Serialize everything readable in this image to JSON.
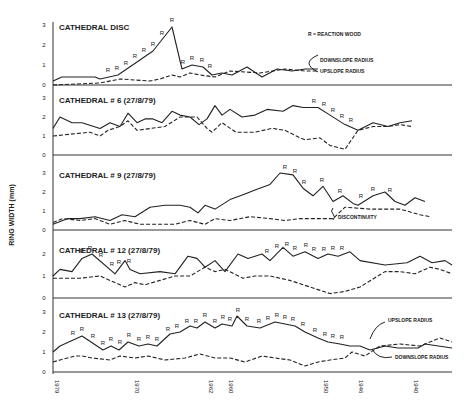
{
  "chart_data": {
    "type": "line",
    "title": "",
    "ylabel": "RING WIDTH (mm)",
    "xlabel": "",
    "x_ticks": [
      "1979",
      "1970",
      "1962",
      "1960",
      "1950",
      "1946",
      "1940"
    ],
    "x_tick_pos": [
      53,
      133,
      207,
      227,
      322,
      357,
      412
    ],
    "legend_note": "R = REACTION WOOD",
    "panels": [
      {
        "title": "CATHEDRAL DISC",
        "yticks": [
          "0",
          "1",
          "2",
          "3"
        ],
        "ylim": [
          0,
          3
        ],
        "annotations": [
          "DOWNSLOPE RADIUS",
          "UPSLOPE RADIUS"
        ],
        "series": [
          {
            "name": "Downslope radius",
            "style": "solid",
            "x": [
              53,
              62,
              95,
              100,
              118,
              153,
              172,
              182,
              192,
              203,
              212,
              222,
              232,
              247,
              262,
              277,
              292,
              305,
              318
            ],
            "values": [
              0.2,
              0.4,
              0.4,
              0.3,
              0.5,
              1.7,
              2.9,
              0.8,
              1.0,
              0.9,
              0.5,
              0.6,
              0.5,
              0.9,
              0.4,
              0.8,
              0.7,
              0.8,
              0.8
            ]
          },
          {
            "name": "Upslope radius",
            "style": "dashed",
            "x": [
              53,
              100,
              120,
              150,
              160,
              172,
              180,
              190,
              200,
              215,
              230,
              260,
              285,
              305,
              318
            ],
            "values": [
              0.0,
              0.1,
              0.3,
              0.2,
              0.3,
              0.5,
              0.4,
              0.6,
              0.5,
              0.4,
              0.7,
              0.6,
              0.8,
              0.7,
              0.7
            ]
          }
        ],
        "r_marks_x": [
          108,
          117,
          126,
          135,
          144,
          153,
          162,
          172,
          183,
          192,
          202,
          210
        ]
      },
      {
        "title": "CATHEDRAL # 6 (27/8/79)",
        "yticks": [
          "0",
          "1",
          "2",
          "3"
        ],
        "ylim": [
          0,
          3
        ],
        "series": [
          {
            "name": "Downslope radius",
            "style": "solid",
            "x": [
              53,
              60,
              72,
              82,
              100,
              110,
              120,
              128,
              137,
              145,
              153,
              162,
              172,
              180,
              190,
              199,
              207,
              215,
              222,
              230,
              242,
              255,
              267,
              283,
              293,
              303,
              318,
              330,
              345,
              358,
              373,
              388,
              400,
              412
            ],
            "values": [
              1.4,
              2.0,
              1.7,
              1.7,
              1.4,
              1.7,
              1.5,
              2.2,
              1.7,
              1.9,
              1.9,
              1.7,
              2.3,
              2.1,
              2.0,
              1.6,
              1.9,
              2.6,
              2.1,
              2.4,
              2.0,
              2.1,
              2.4,
              2.3,
              2.6,
              2.5,
              2.5,
              2.1,
              1.6,
              1.3,
              1.7,
              1.5,
              1.7,
              1.8
            ]
          },
          {
            "name": "Upslope radius",
            "style": "dashed",
            "x": [
              53,
              90,
              100,
              108,
              120,
              128,
              137,
              165,
              180,
              197,
              207,
              212,
              222,
              236,
              255,
              272,
              285,
              300,
              305,
              320,
              330,
              345,
              358,
              373,
              388,
              400,
              412
            ],
            "values": [
              1.0,
              1.2,
              1.0,
              1.3,
              1.5,
              1.8,
              1.3,
              1.5,
              2.0,
              2.0,
              1.4,
              1.2,
              1.7,
              1.2,
              1.2,
              1.4,
              1.3,
              0.9,
              0.8,
              0.9,
              0.5,
              0.3,
              1.3,
              1.5,
              1.5,
              1.6,
              1.5
            ]
          }
        ],
        "r_marks_x": [
          314,
          324,
          333,
          342,
          351
        ]
      },
      {
        "title": "CATHEDRAL # 9 (27/8/79)",
        "yticks": [
          "0",
          "1",
          "2",
          "3"
        ],
        "ylim": [
          0,
          3
        ],
        "annotations": [
          "DISCONTINUITY"
        ],
        "series": [
          {
            "name": "Downslope radius",
            "style": "solid",
            "x": [
              53,
              68,
              80,
              95,
              110,
              122,
              135,
              150,
              165,
              180,
              190,
              198,
              205,
              215,
              230,
              245,
              255,
              270,
              280,
              293,
              303,
              313,
              323,
              333,
              343,
              353,
              358,
              373,
              385,
              395,
              405,
              415,
              425
            ],
            "values": [
              0.3,
              0.6,
              0.6,
              0.7,
              0.5,
              0.8,
              0.7,
              1.2,
              1.3,
              1.3,
              1.2,
              0.9,
              1.3,
              1.1,
              1.6,
              1.9,
              2.1,
              2.4,
              3.0,
              2.9,
              2.2,
              1.8,
              2.3,
              1.5,
              1.8,
              1.4,
              1.3,
              1.8,
              2.0,
              1.5,
              1.3,
              1.7,
              1.5
            ]
          },
          {
            "name": "Upslope radius",
            "style": "dashed",
            "x": [
              53,
              63,
              80,
              95,
              110,
              125,
              140,
              160,
              175,
              190,
              205,
              215,
              230,
              250,
              270,
              285,
              300,
              330,
              333,
              345,
              370,
              400,
              420,
              430
            ],
            "values": [
              0.4,
              0.6,
              0.5,
              0.6,
              0.3,
              0.5,
              0.3,
              0.3,
              0.3,
              0.5,
              0.3,
              0.6,
              0.5,
              0.7,
              0.6,
              0.5,
              0.6,
              0.6,
              0.6,
              1.2,
              1.1,
              1.1,
              0.8,
              0.7
            ]
          }
        ],
        "r_marks_x": [
          285,
          295,
          304,
          322,
          340,
          361,
          373,
          390
        ]
      },
      {
        "title": "CATHEDRAL # 12 (27/8/79)",
        "yticks": [
          "0",
          "1",
          "2"
        ],
        "ylim": [
          0,
          2.3
        ],
        "series": [
          {
            "name": "Downslope radius",
            "style": "solid",
            "x": [
              53,
              60,
              72,
              82,
              92,
              115,
              125,
              130,
              140,
              160,
              175,
              188,
              197,
              205,
              215,
              225,
              238,
              248,
              262,
              270,
              283,
              293,
              305,
              318,
              328,
              338,
              350,
              360,
              385,
              407,
              420,
              432,
              445,
              452
            ],
            "values": [
              1.0,
              1.3,
              1.2,
              1.8,
              2.0,
              1.1,
              1.7,
              1.3,
              1.1,
              1.2,
              1.1,
              1.9,
              1.8,
              1.4,
              1.7,
              1.2,
              2.0,
              1.8,
              2.0,
              1.7,
              2.3,
              1.9,
              2.1,
              1.8,
              2.0,
              1.9,
              2.1,
              1.7,
              1.5,
              1.6,
              1.9,
              1.6,
              1.7,
              1.5
            ]
          },
          {
            "name": "Upslope radius",
            "style": "dashed",
            "x": [
              53,
              80,
              100,
              115,
              125,
              135,
              145,
              160,
              175,
              190,
              205,
              215,
              225,
              243,
              255,
              270,
              290,
              310,
              330,
              345,
              360,
              385,
              400,
              415,
              430,
              440,
              452
            ],
            "values": [
              0.9,
              0.9,
              1.0,
              0.7,
              0.5,
              0.7,
              0.6,
              0.8,
              1.0,
              1.0,
              1.4,
              1.2,
              1.3,
              0.9,
              1.0,
              1.0,
              0.8,
              0.5,
              0.2,
              0.3,
              0.5,
              1.2,
              1.2,
              1.1,
              1.4,
              1.3,
              1.1
            ]
          }
        ],
        "r_marks_x": [
          82,
          90,
          101,
          112,
          119,
          129,
          267,
          277,
          287,
          295,
          306,
          314,
          324,
          333,
          342
        ]
      },
      {
        "title": "CATHEDRAL # 13 (27/8/79)",
        "yticks": [
          "0",
          "1",
          "2",
          "3"
        ],
        "ylim": [
          0,
          3
        ],
        "annotations": [
          "UPSLOPE RADIUS",
          "DOWNSLOPE RADIUS"
        ],
        "series": [
          {
            "name": "Downslope radius",
            "style": "solid",
            "x": [
              53,
              60,
              82,
              103,
              111,
              119,
              128,
              139,
              148,
              157,
              170,
              180,
              190,
              197,
              205,
              215,
              222,
              232,
              237,
              247,
              260,
              275,
              285,
              295,
              305,
              318,
              328,
              340,
              350,
              360,
              370,
              385,
              398,
              418,
              425,
              452
            ],
            "values": [
              1.0,
              1.3,
              1.8,
              1.1,
              1.3,
              1.1,
              1.5,
              1.3,
              1.4,
              1.3,
              1.9,
              2.0,
              2.3,
              2.2,
              2.5,
              2.2,
              2.4,
              2.3,
              2.8,
              2.3,
              2.2,
              2.5,
              2.4,
              2.3,
              2.0,
              1.7,
              1.5,
              1.4,
              1.3,
              1.3,
              1.1,
              1.3,
              1.2,
              1.2,
              1.4,
              1.2
            ]
          },
          {
            "name": "Upslope radius",
            "style": "dashed",
            "x": [
              53,
              60,
              75,
              82,
              92,
              110,
              120,
              135,
              148,
              165,
              185,
              200,
              215,
              230,
              245,
              262,
              275,
              290,
              305,
              318,
              330,
              345,
              352,
              365,
              380,
              400,
              420,
              440,
              452
            ],
            "values": [
              0.5,
              0.6,
              0.8,
              0.8,
              0.7,
              0.6,
              0.8,
              0.7,
              0.8,
              0.6,
              0.7,
              0.9,
              0.7,
              0.7,
              0.5,
              0.8,
              0.7,
              0.6,
              0.3,
              0.5,
              0.6,
              0.7,
              1.0,
              0.8,
              1.3,
              1.4,
              1.3,
              1.7,
              1.5
            ]
          }
        ],
        "r_marks_x": [
          73,
          82,
          93,
          103,
          111,
          120,
          129,
          139,
          148,
          157,
          168,
          177,
          187,
          196,
          205,
          215,
          223,
          230,
          238,
          247,
          259,
          268,
          277,
          285,
          293,
          303,
          315,
          325,
          333,
          342
        ]
      }
    ]
  }
}
